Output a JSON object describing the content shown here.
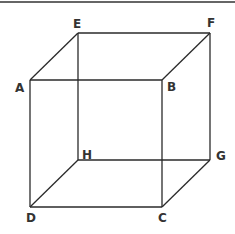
{
  "diagram": {
    "type": "cube-wireframe",
    "vertices": {
      "A": "A",
      "B": "B",
      "C": "C",
      "D": "D",
      "E": "E",
      "F": "F",
      "G": "G",
      "H": "H"
    },
    "edges": [
      [
        "A",
        "B"
      ],
      [
        "B",
        "C"
      ],
      [
        "C",
        "D"
      ],
      [
        "D",
        "A"
      ],
      [
        "E",
        "F"
      ],
      [
        "F",
        "G"
      ],
      [
        "G",
        "H"
      ],
      [
        "H",
        "E"
      ],
      [
        "A",
        "E"
      ],
      [
        "B",
        "F"
      ],
      [
        "C",
        "G"
      ],
      [
        "D",
        "H"
      ]
    ],
    "colors": {
      "line": "#2a2a2a",
      "text": "#333333"
    }
  }
}
